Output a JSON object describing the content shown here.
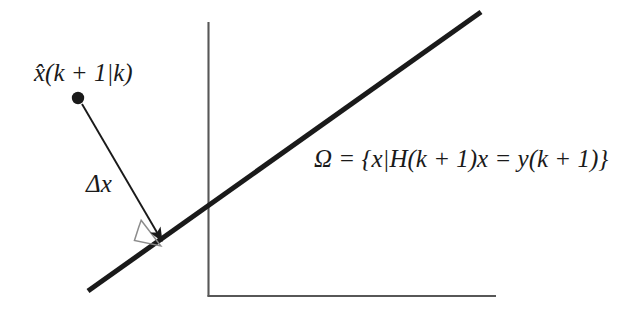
{
  "figure": {
    "background_color": "#ffffff",
    "ink_color": "#1a1a1a",
    "axis_color": "#555555",
    "right_angle_color": "#888888",
    "labels": {
      "predicted_state": "x̂(k + 1|k)",
      "correction": "Δx",
      "constraint_set": "Ω = {x|H(k + 1)x = y(k + 1)}"
    },
    "elements": {
      "state_point": "state-point-dot",
      "correction_arrow": "correction-arrow",
      "right_angle_marker": "right-angle-marker",
      "constraint_line": "constraint-hyperplane-line",
      "vertical_axis": "vertical-axis",
      "horizontal_axis": "horizontal-axis"
    },
    "geometry": {
      "state_point": {
        "cx": 78,
        "cy": 98,
        "r": 6
      },
      "arrow": {
        "x1": 82,
        "y1": 104,
        "x2": 163,
        "y2": 243
      },
      "constraint_line": {
        "x1": 88,
        "y1": 291,
        "x2": 481,
        "y2": 12,
        "width": 5
      },
      "vertical_axis": {
        "x": 208,
        "y1": 22,
        "y2": 296
      },
      "horizontal_axis": {
        "y": 296,
        "x1": 208,
        "x2": 496
      },
      "right_angle_marker": {
        "size": 27
      }
    }
  }
}
